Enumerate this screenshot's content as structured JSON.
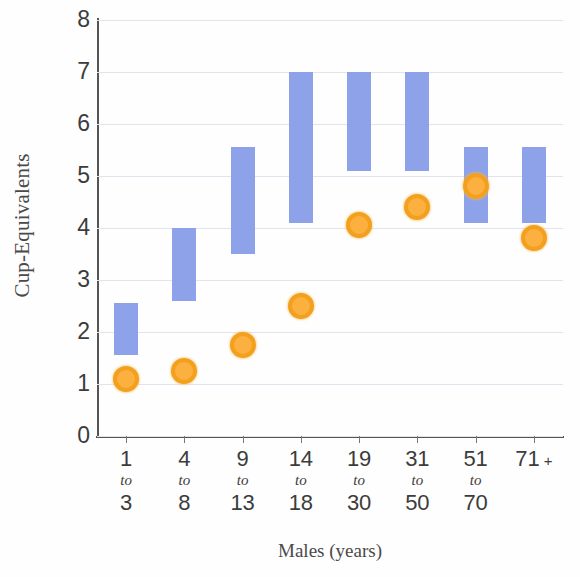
{
  "chart_data": {
    "type": "bar",
    "title": "",
    "subtitle": "",
    "xlabel": "Males (years)",
    "ylabel": "Cup-Equivalents",
    "categories": [
      "1 to 3",
      "4 to 8",
      "9 to 13",
      "14 to 18",
      "19 to 30",
      "31 to 50",
      "51 to 70",
      "71 +"
    ],
    "category_lines": [
      {
        "from": "1",
        "word": "to",
        "to": "3"
      },
      {
        "from": "4",
        "word": "to",
        "to": "8"
      },
      {
        "from": "9",
        "word": "to",
        "to": "13"
      },
      {
        "from": "14",
        "word": "to",
        "to": "18"
      },
      {
        "from": "19",
        "word": "to",
        "to": "30"
      },
      {
        "from": "31",
        "word": "to",
        "to": "50"
      },
      {
        "from": "51",
        "word": "to",
        "to": "70"
      },
      {
        "from": "71",
        "word": "+",
        "to": ""
      }
    ],
    "ylim": [
      0,
      8
    ],
    "ytick_labels": [
      "8",
      "7",
      "6",
      "5",
      "4",
      "3",
      "2",
      "1",
      "0"
    ],
    "ytick_values": [
      8,
      7,
      6,
      5,
      4,
      3,
      2,
      1,
      0
    ],
    "grid": true,
    "legend": "none",
    "series": [
      {
        "name": "Recommended intake range",
        "type": "range-bar",
        "color": "#8da2e8",
        "low": [
          1.55,
          2.6,
          3.5,
          4.1,
          5.1,
          5.1,
          4.1,
          4.1
        ],
        "high": [
          2.55,
          4.0,
          5.55,
          7.0,
          7.0,
          7.0,
          5.55,
          5.55
        ]
      },
      {
        "name": "Average intake",
        "type": "point",
        "color": "#fbb040",
        "edge_color": "#f3a01f",
        "values": [
          1.1,
          1.25,
          1.75,
          2.5,
          4.05,
          4.4,
          4.8,
          3.8
        ]
      }
    ]
  },
  "colors": {
    "bar": "#8da2e8",
    "point_fill": "#fbb040",
    "point_edge": "#f3a01f",
    "axis": "#555555",
    "grid": "#e3e3ee",
    "text": "#3c3c3c"
  }
}
